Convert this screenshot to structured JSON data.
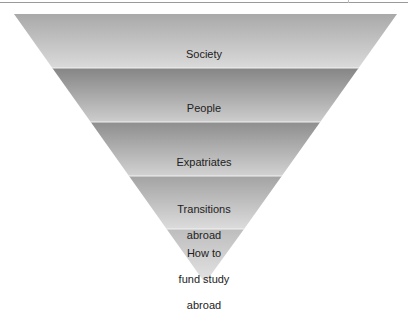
{
  "diagram": {
    "type": "inverted-funnel",
    "colors": {
      "band_top_dark": "#8c8c8c",
      "band_bottom_light": "#d6d6d6",
      "text": "#222222",
      "separator": "#f2f2f2"
    },
    "bands": [
      {
        "label": "Society",
        "lines": [
          "Society"
        ]
      },
      {
        "label": "People",
        "lines": [
          "People"
        ]
      },
      {
        "label": "Expatriates",
        "lines": [
          "Expatriates"
        ]
      },
      {
        "label": "Transitions abroad",
        "lines": [
          "Transitions",
          "abroad"
        ]
      },
      {
        "label": "How to fund study abroad",
        "lines": [
          "How to",
          "fund study",
          "abroad"
        ]
      }
    ]
  }
}
